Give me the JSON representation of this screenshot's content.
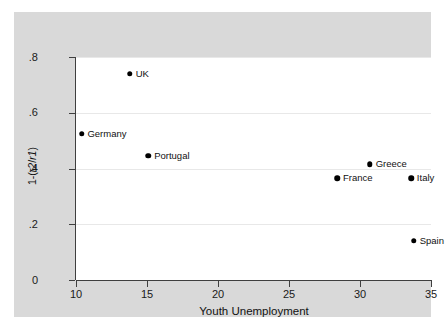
{
  "chart_data": {
    "type": "scatter",
    "title": "",
    "xlabel": "Youth Unemployment",
    "ylabel": "1-(r2/r1)",
    "xlim": [
      10,
      35
    ],
    "ylim": [
      0,
      0.8
    ],
    "xticks": [
      "10",
      "15",
      "20",
      "25",
      "30",
      "35"
    ],
    "xtick_values": [
      10,
      15,
      20,
      25,
      30,
      35
    ],
    "yticks": [
      ".8",
      ".6",
      ".4",
      ".2",
      "0"
    ],
    "ytick_values": [
      0.8,
      0.6,
      0.4,
      0.2,
      0
    ],
    "grid": "horizontal",
    "legend": "none",
    "points": [
      {
        "label": "Germany",
        "x": 10.4,
        "y": 0.525
      },
      {
        "label": "UK",
        "x": 13.8,
        "y": 0.74
      },
      {
        "label": "Portugal",
        "x": 15.1,
        "y": 0.445
      },
      {
        "label": "France",
        "x": 28.4,
        "y": 0.365
      },
      {
        "label": "Greece",
        "x": 30.7,
        "y": 0.415
      },
      {
        "label": "Italy",
        "x": 33.6,
        "y": 0.365
      },
      {
        "label": "Spain",
        "x": 33.8,
        "y": 0.14
      }
    ]
  },
  "colors": {
    "graph_background": "#d9d9d9",
    "plot_background": "#ffffff",
    "axis": "#3f3f3f",
    "gridline": "#e8e8e8",
    "marker": "#000000",
    "text": "#111111"
  }
}
